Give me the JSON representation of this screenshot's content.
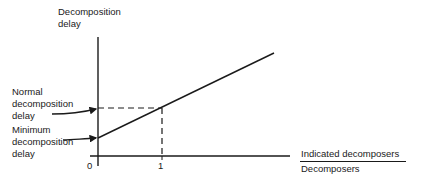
{
  "diagram": {
    "y_axis_label": [
      "Decomposition",
      "delay"
    ],
    "x_axis_label": {
      "numerator": "Indicated decomposers",
      "denominator": "Decomposers"
    },
    "annotations": {
      "normal": [
        "Normal",
        "decomposition",
        "delay"
      ],
      "minimum": [
        "Minimum",
        "decomposition",
        "delay"
      ]
    },
    "x_ticks": [
      "0",
      "1"
    ],
    "relationship": "Decomposition delay increases linearly with the ratio of indicated decomposers to decomposers, starting at the minimum decomposition delay at 0 and reaching the normal decomposition delay at 1",
    "line_color": "#1a1a1a"
  }
}
